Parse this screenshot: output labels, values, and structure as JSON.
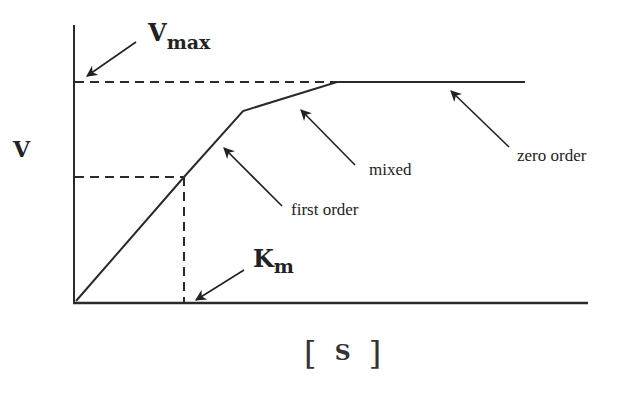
{
  "diagram": {
    "title": "",
    "y_axis_label": "V",
    "x_axis_label": "[ S ]",
    "x_axis_bracket_left": "[",
    "x_axis_bracket_right": "]",
    "x_axis_symbol": "S",
    "vmax_label": {
      "main": "V",
      "sub": "max"
    },
    "km_label": {
      "main": "K",
      "sub": "m"
    },
    "annotations": [
      {
        "id": "first-order",
        "text": "first order"
      },
      {
        "id": "mixed",
        "text": "mixed"
      },
      {
        "id": "zero-order",
        "text": "zero order"
      }
    ],
    "colors": {
      "line": "#2a2a2a",
      "background": "#ffffff"
    }
  }
}
